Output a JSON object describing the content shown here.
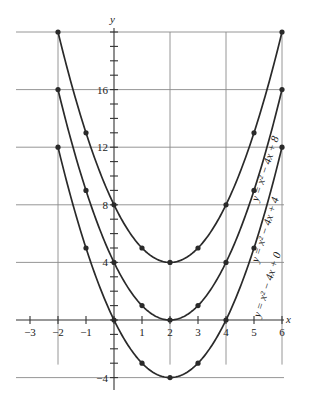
{
  "chart_data": {
    "type": "line",
    "title": "",
    "xlabel": "x",
    "ylabel": "y",
    "xlim": [
      -3,
      6
    ],
    "ylim": [
      -4,
      20
    ],
    "grid": true,
    "x_ticks": [
      -3,
      -2,
      -1,
      1,
      2,
      3,
      4,
      5,
      6
    ],
    "y_ticks": [
      -4,
      4,
      8,
      12,
      16
    ],
    "x_tick_labels": [
      "−3",
      "−2",
      "−1",
      "1",
      "2",
      "3",
      "4",
      "5",
      "6"
    ],
    "y_tick_labels": [
      "−4",
      "4",
      "8",
      "12",
      "16"
    ],
    "x": [
      -2,
      -1,
      0,
      1,
      2,
      3,
      4,
      5,
      6
    ],
    "series": [
      {
        "name": "y = x² − 4x + 8",
        "values": [
          20,
          13,
          8,
          5,
          4,
          5,
          8,
          13,
          20
        ]
      },
      {
        "name": "y = x² − 4x + 4",
        "values": [
          16,
          9,
          4,
          1,
          0,
          1,
          4,
          9,
          16
        ]
      },
      {
        "name": "y = x² − 4x + 0",
        "values": [
          12,
          5,
          0,
          -3,
          -4,
          -3,
          0,
          5,
          12
        ]
      }
    ]
  },
  "labels": {
    "x_axis": "x",
    "y_axis": "y",
    "curve1": "y = x² − 4x + 8",
    "curve2": "y = x² − 4x + 4",
    "curve3": "y = x² − 4x + 0"
  }
}
